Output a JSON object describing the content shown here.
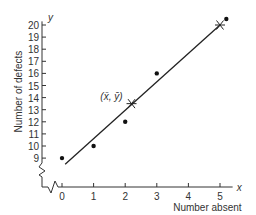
{
  "chart_data": {
    "type": "scatter",
    "title": "",
    "xlabel": "Number absent",
    "ylabel": "Number of defects",
    "x_axis_symbol": "x",
    "y_axis_symbol": "y",
    "x_ticks": [
      "0",
      "1",
      "2",
      "3",
      "4",
      "5"
    ],
    "y_ticks": [
      "9",
      "10",
      "11",
      "12",
      "13",
      "14",
      "15",
      "16",
      "17",
      "18",
      "19",
      "20"
    ],
    "xlim": [
      0,
      5.3
    ],
    "ylim": [
      8,
      20.6
    ],
    "axis_break": true,
    "grid": false,
    "series": [
      {
        "name": "observations",
        "type": "scatter",
        "x": [
          0,
          1,
          2,
          3,
          5.2
        ],
        "y": [
          9,
          10,
          12,
          16,
          20.5
        ]
      },
      {
        "name": "regression line",
        "type": "line",
        "x": [
          0.1,
          5.0
        ],
        "y": [
          8.5,
          20
        ]
      },
      {
        "name": "marked points",
        "type": "star",
        "x": [
          2.2,
          5.0
        ],
        "y": [
          13.5,
          20
        ]
      }
    ],
    "annotations": [
      {
        "text": "(x̄, ȳ)",
        "x": 2.2,
        "y": 13.5
      }
    ]
  }
}
